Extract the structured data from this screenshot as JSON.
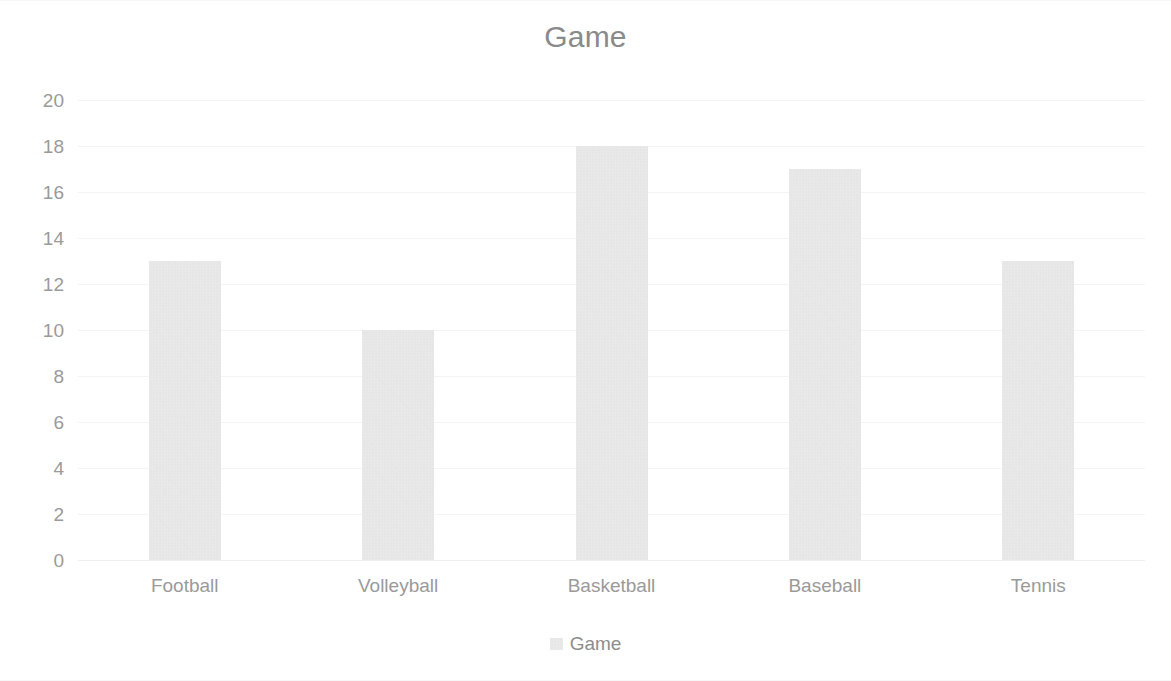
{
  "chart_data": {
    "type": "bar",
    "title": "Game",
    "xlabel": "",
    "ylabel": "",
    "categories": [
      "Football",
      "Volleyball",
      "Basketball",
      "Baseball",
      "Tennis"
    ],
    "values": [
      13,
      10,
      18,
      17,
      13
    ],
    "series": [
      {
        "name": "Game",
        "values": [
          13,
          10,
          18,
          17,
          13
        ]
      }
    ],
    "ylim": [
      0,
      20
    ],
    "ytick_step": 2,
    "yticks": [
      20,
      18,
      16,
      14,
      12,
      10,
      8,
      6,
      4,
      2,
      0
    ],
    "ytick_labels": [
      "20",
      "18",
      "16",
      "14",
      "12",
      "10",
      "8",
      "6",
      "4",
      "2",
      "0"
    ],
    "grid": true,
    "grid_axis": "y",
    "legend": true,
    "legend_position": "bottom",
    "legend_entries": [
      "Game"
    ],
    "colors": {
      "bar_fill": "#dedede",
      "grid": "#f4f4f4",
      "title_text": "#8a8a8a",
      "tick_text": "#9a9a9a",
      "legend_text": "#8d8d8d",
      "background": "#ffffff"
    }
  },
  "legend": {
    "swatch_icon": "legend-swatch-icon"
  }
}
